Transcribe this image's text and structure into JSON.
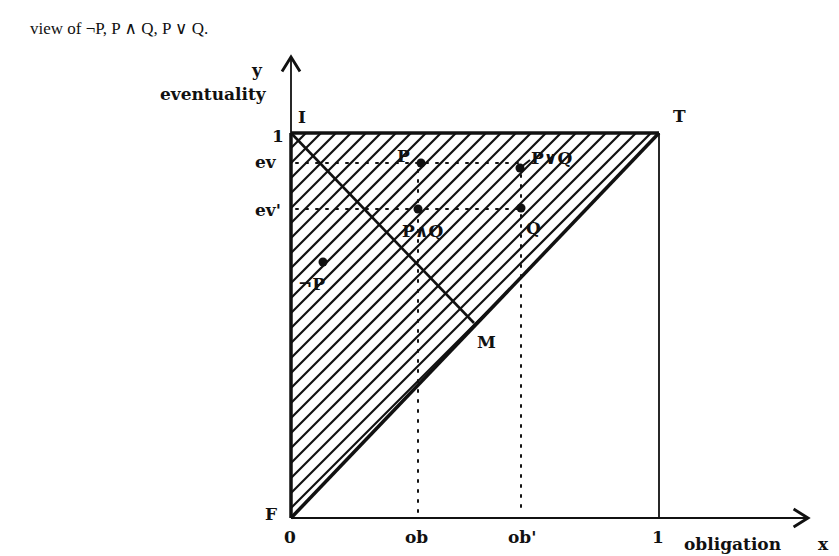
{
  "caption": "view of ¬P, P ∧ Q, P ∨ Q.",
  "axes": {
    "y_symbol": "y",
    "y_label": "eventuality",
    "x_symbol": "x",
    "x_label": "obligation",
    "origin": "0",
    "x_one": "1",
    "y_one": "1",
    "x_ticks": [
      "ob",
      "ob'"
    ],
    "y_ticks": [
      "ev",
      "ev'"
    ]
  },
  "corners": {
    "I": "I",
    "T": "T",
    "F": "F",
    "M": "M"
  },
  "points": [
    {
      "id": "not-p",
      "label": "¬P"
    },
    {
      "id": "p",
      "label": "P"
    },
    {
      "id": "p-and-q",
      "label": "P∧Q"
    },
    {
      "id": "p-or-q",
      "label": "P∨Q"
    },
    {
      "id": "q",
      "label": "Q"
    }
  ],
  "colors": {
    "ink": "#111111",
    "background": "#ffffff"
  }
}
